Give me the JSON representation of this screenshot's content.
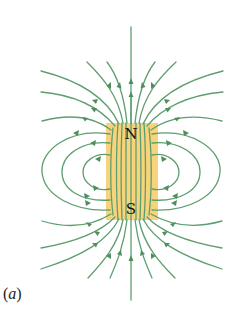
{
  "figure": {
    "caption_open": "(",
    "caption_letter": "a",
    "caption_close": ")"
  },
  "magnet": {
    "north_label": "N",
    "south_label": "S",
    "fill_color": "#f6cf6e",
    "x": 106,
    "y": 123,
    "width": 52,
    "height": 97
  },
  "field_lines": {
    "color": "#5e9e6e",
    "arrow_color": "#4f8f5e",
    "open_lines_top": 11,
    "open_lines_bottom": 11,
    "closed_loops_per_side": 3,
    "direction": "out of N, into S"
  }
}
